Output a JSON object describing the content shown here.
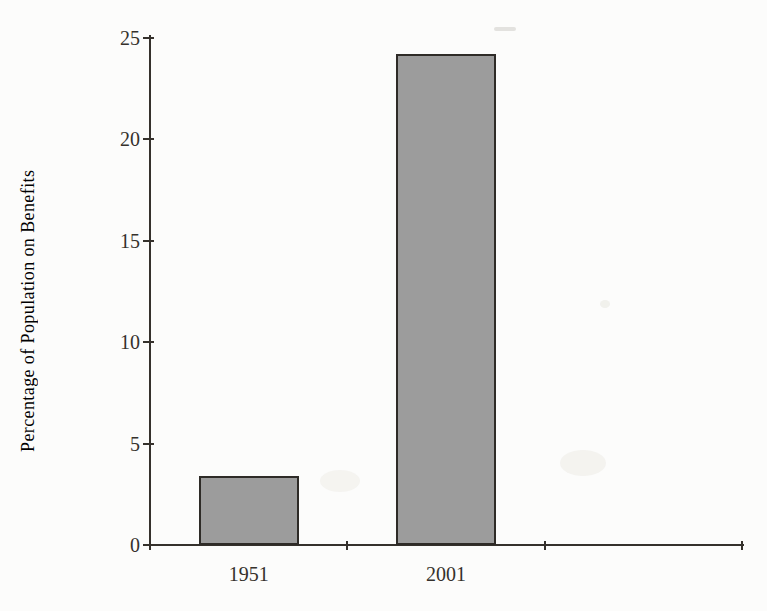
{
  "chart_data": {
    "type": "bar",
    "categories": [
      "1951",
      "2001"
    ],
    "values": [
      3.4,
      24.2
    ],
    "title": "",
    "xlabel": "",
    "ylabel": "Percentage of Population on Benefits",
    "ylim": [
      0,
      25
    ],
    "yticks": [
      0,
      5,
      10,
      15,
      20,
      25
    ],
    "grid": false,
    "legend": "none",
    "ink_color": "#35312c",
    "bar_fill": "#9c9c9c",
    "bar_border": "#2e2b27"
  }
}
